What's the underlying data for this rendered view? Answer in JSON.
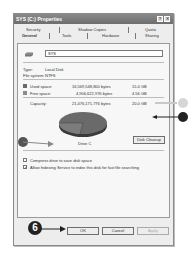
{
  "window": {
    "title": "SYS (C:) Properties",
    "help_button": "?",
    "close_button": "✕"
  },
  "tabs": {
    "row1": [
      {
        "label": "Security"
      },
      {
        "label": "Shadow Copies"
      },
      {
        "label": "Quota"
      }
    ],
    "row2": [
      {
        "label": "General",
        "selected": true
      },
      {
        "label": "Tools"
      },
      {
        "label": "Hardware"
      },
      {
        "label": "Sharing"
      }
    ]
  },
  "general": {
    "drive_icon": "hard-drive-icon",
    "volume_name": "SYS",
    "type_label": "Type:",
    "type_value": "Local Disk",
    "fs_label": "File system:",
    "fs_value": "NTFS",
    "used": {
      "label": "Used space:",
      "bytes": "16,569,548,800 bytes",
      "size": "15.4 GB",
      "color": "#6a6a6a"
    },
    "free": {
      "label": "Free space:",
      "bytes": "4,906,622,976 bytes",
      "size": "4.56 GB",
      "color": "#8d8d8d"
    },
    "capacity": {
      "label": "Capacity:",
      "bytes": "21,476,171,776 bytes",
      "size": "20.0 GB"
    },
    "drive_label": "Drive C",
    "disk_cleanup_label": "Disk Cleanup",
    "compress_label": "Compress drive to save disk space",
    "compress_checked": false,
    "index_label": "Allow Indexing Service to index this disk for fast file searching",
    "index_checked": true,
    "used_fraction": 0.77
  },
  "buttons": {
    "ok": "OK",
    "cancel": "Cancel",
    "apply": "Apply"
  },
  "annotations": {
    "step_number": "6"
  }
}
